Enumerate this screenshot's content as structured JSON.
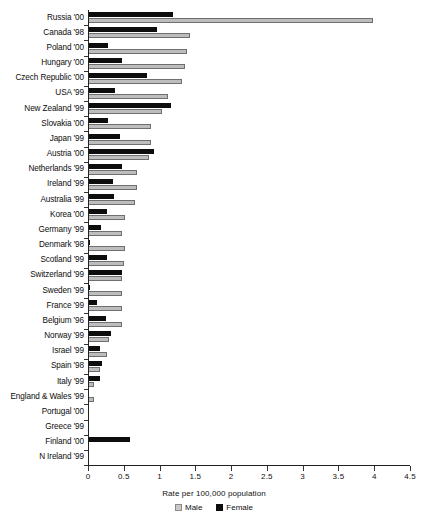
{
  "chart_data": {
    "type": "bar",
    "orientation": "horizontal",
    "title": "",
    "xlabel": "Rate per 100,000 population",
    "ylabel": "",
    "xlim": [
      0,
      4.5
    ],
    "xticks": [
      "0",
      "0.5",
      "1",
      "1.5",
      "2",
      "2.5",
      "3",
      "3.5",
      "4",
      "4.5"
    ],
    "xtick_values": [
      0,
      0.5,
      1,
      1.5,
      2,
      2.5,
      3,
      3.5,
      4,
      4.5
    ],
    "grid": false,
    "legend_position": "bottom-center",
    "categories": [
      "Russia '00",
      "Canada '98",
      "Poland '00",
      "Hungary '00",
      "Czech Republic '00",
      "USA '99",
      "New Zealand '99",
      "Slovakia '00",
      "Japan '99",
      "Austria '00",
      "Netherlands '99",
      "Ireland '99",
      "Australia '99",
      "Korea '00",
      "Germany '99",
      "Denmark '98",
      "Scotland '99",
      "Switzerland '99",
      "Sweden '99",
      "France '99",
      "Belgium '96",
      "Norway '99",
      "Israel '99",
      "Spain '98",
      "Italy '99",
      "England & Wales '99",
      "Portugal '00",
      "Greece '99",
      "Finland '00",
      "N Ireland '99"
    ],
    "series": [
      {
        "name": "Male",
        "color": "#bdbdbd",
        "values": [
          3.98,
          1.42,
          1.38,
          1.36,
          1.32,
          1.12,
          1.03,
          0.88,
          0.88,
          0.85,
          0.68,
          0.68,
          0.66,
          0.52,
          0.48,
          0.52,
          0.51,
          0.47,
          0.48,
          0.47,
          0.47,
          0.29,
          0.27,
          0.17,
          0.09,
          0.09,
          0.0,
          0.0,
          0.0,
          0.0
        ]
      },
      {
        "name": "Female",
        "color": "#0d0d0d",
        "values": [
          1.19,
          0.97,
          0.28,
          0.47,
          0.83,
          0.38,
          1.16,
          0.28,
          0.45,
          0.92,
          0.47,
          0.35,
          0.36,
          0.27,
          0.18,
          0.02,
          0.27,
          0.47,
          0.02,
          0.13,
          0.25,
          0.32,
          0.17,
          0.19,
          0.17,
          0.0,
          0.0,
          0.0,
          0.58,
          0.0
        ]
      }
    ]
  },
  "legend": {
    "items": [
      {
        "label": "Male",
        "swatch": "male-swatch"
      },
      {
        "label": "Female",
        "swatch": "female-swatch"
      }
    ]
  }
}
